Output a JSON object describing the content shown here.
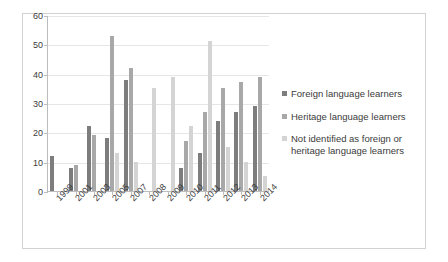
{
  "chart_data": {
    "type": "bar",
    "title": "",
    "subtitle": "",
    "xlabel": "",
    "ylabel": "",
    "ylim": [
      0,
      60
    ],
    "yticks": [
      0,
      10,
      20,
      30,
      40,
      50,
      60
    ],
    "grid": true,
    "legend_position": "right",
    "categories": [
      "1999",
      "2001",
      "2003",
      "2005",
      "2007",
      "2008",
      "2009",
      "2010",
      "2011",
      "2012",
      "2013",
      "2014"
    ],
    "series": [
      {
        "name": "Foreign language learners",
        "color": "#7d7d7d",
        "values": [
          12,
          8,
          22,
          18,
          38,
          null,
          null,
          8,
          13,
          24,
          27,
          29
        ]
      },
      {
        "name": "Heritage language learners",
        "color": "#a8a8a8",
        "values": [
          null,
          9,
          19,
          53,
          42,
          null,
          null,
          17,
          27,
          35,
          37,
          39
        ]
      },
      {
        "name": "Not identified as foreign or heritage language learners",
        "color": "#d4d4d4",
        "values": [
          null,
          null,
          null,
          13,
          10,
          35,
          39,
          22,
          51,
          15,
          10,
          5
        ]
      }
    ]
  },
  "legend": {
    "items": [
      {
        "label": "Foreign language learners",
        "color": "#7d7d7d"
      },
      {
        "label": "Heritage language learners",
        "color": "#a8a8a8"
      },
      {
        "label": "Not identified as foreign or heritage language learners",
        "color": "#d4d4d4"
      }
    ]
  }
}
